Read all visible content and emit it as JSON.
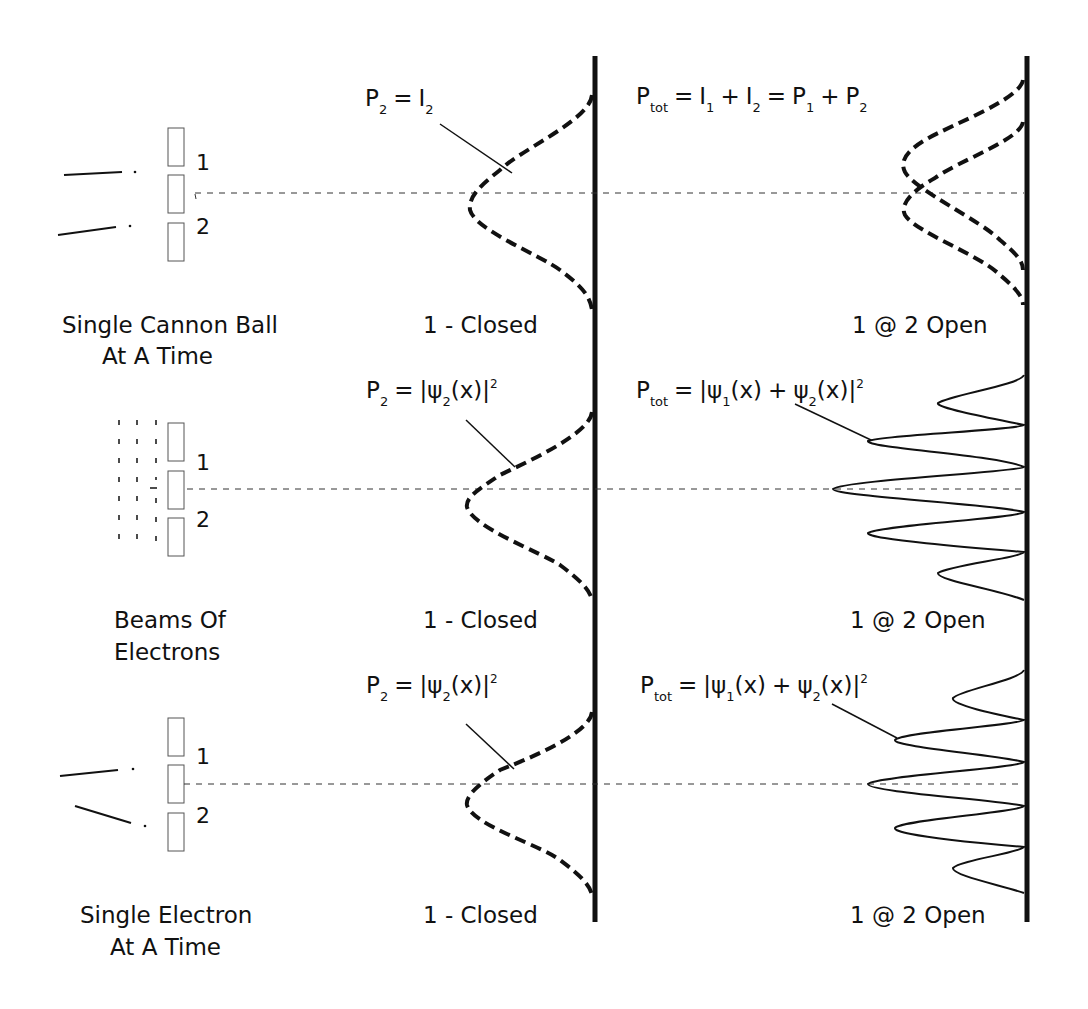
{
  "diagram": {
    "colors": {
      "ink": "#111111",
      "slit_stroke": "#555555",
      "background": "#ffffff"
    },
    "rows": [
      {
        "id": "cannon",
        "source_label": [
          "Single Cannon Ball",
          "At A Time"
        ],
        "source_type": "particle-trajectories",
        "slits": [
          "1",
          "2"
        ],
        "closed_panel": {
          "formula": {
            "lhs": "P",
            "lhs_sub": "2",
            "rhs": "= I",
            "rhs_sub": "2"
          },
          "label": "1 - Closed",
          "curve": "single-dashed-bell"
        },
        "open_panel": {
          "formula_text": "P_tot = I_1 + I_2 = P_1 + P_2",
          "label": "1 @ 2 Open",
          "curve": "two-overlapping-dashed-bells"
        }
      },
      {
        "id": "beams",
        "source_label": [
          "Beams Of",
          "Electrons"
        ],
        "source_type": "dashed-wavefronts",
        "slits": [
          "1",
          "2"
        ],
        "closed_panel": {
          "formula_text": "P_2 = |ψ_2(x)|^2",
          "label": "1 - Closed",
          "curve": "single-dashed-bell"
        },
        "open_panel": {
          "formula_text": "P_tot = |ψ_1(x) + ψ_2(x)|^2",
          "label": "1 @ 2 Open",
          "curve": "interference-fringes"
        }
      },
      {
        "id": "single-electron",
        "source_label": [
          "Single Electron",
          "At A Time"
        ],
        "source_type": "particle-trajectories",
        "slits": [
          "1",
          "2"
        ],
        "closed_panel": {
          "formula_text": "P_2 = |ψ_2(x)|^2",
          "label": "1 - Closed",
          "curve": "single-dashed-bell"
        },
        "open_panel": {
          "formula_text": "P_tot = |ψ_1(x) + ψ_2(x)|^2",
          "label": "1 @ 2 Open",
          "curve": "interference-fringes"
        }
      }
    ],
    "text": {
      "r1_src_a": "Single Cannon Ball",
      "r1_src_b": "At A Time",
      "r2_src_a": "Beams Of",
      "r2_src_b": "Electrons",
      "r3_src_a": "Single Electron",
      "r3_src_b": "At A Time",
      "slit1": "1",
      "slit2": "2",
      "closed": "1 - Closed",
      "open": "1 @ 2 Open",
      "P": "P",
      "I": "I",
      "two": "2",
      "one": "1",
      "tot": "tot",
      "eq": "=",
      "plus": "+",
      "psi": "ψ",
      "x_paren": "(x)",
      "bar": "|",
      "sq": "2"
    }
  }
}
